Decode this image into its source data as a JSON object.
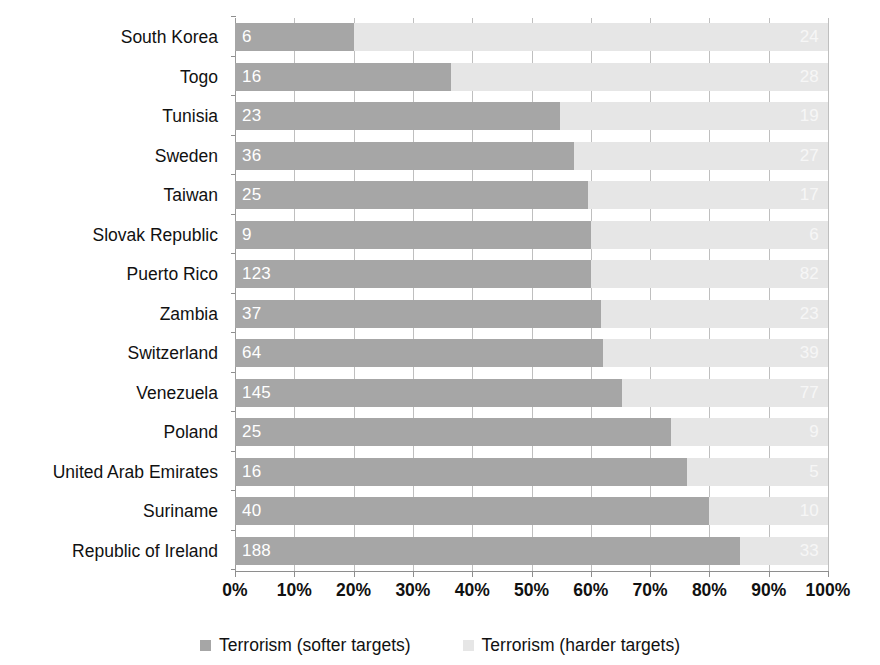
{
  "chart_data": {
    "type": "bar",
    "subtype": "stacked-horizontal-100-percent",
    "title": "",
    "subtitle": "",
    "xlabel": "",
    "ylabel": "",
    "xlim": [
      0,
      100
    ],
    "xtick_labels": [
      "0%",
      "10%",
      "20%",
      "30%",
      "40%",
      "50%",
      "60%",
      "70%",
      "80%",
      "90%",
      "100%"
    ],
    "xtick_values": [
      0,
      10,
      20,
      30,
      40,
      50,
      60,
      70,
      80,
      90,
      100
    ],
    "grid": true,
    "grid_axis": "x",
    "legend_position": "bottom",
    "categories": [
      "South Korea",
      "Togo",
      "Tunisia",
      "Sweden",
      "Taiwan",
      "Slovak Republic",
      "Puerto Rico",
      "Zambia",
      "Switzerland",
      "Venezuela",
      "Poland",
      "United Arab Emirates",
      "Suriname",
      "Republic of Ireland"
    ],
    "series": [
      {
        "name": "Terrorism (softer targets)",
        "color": "#a6a6a6",
        "values": [
          6,
          16,
          23,
          36,
          25,
          9,
          123,
          37,
          64,
          145,
          25,
          16,
          40,
          188
        ],
        "percents": [
          20.0,
          36.4,
          54.8,
          57.1,
          59.5,
          60.0,
          60.0,
          61.7,
          62.1,
          65.3,
          73.5,
          76.2,
          80.0,
          85.1
        ]
      },
      {
        "name": "Terrorism (harder targets)",
        "color": "#e6e6e6",
        "values": [
          24,
          28,
          19,
          27,
          17,
          6,
          82,
          23,
          39,
          77,
          9,
          5,
          10,
          33
        ],
        "percents": [
          80.0,
          63.6,
          45.2,
          42.9,
          40.5,
          40.0,
          40.0,
          38.3,
          37.9,
          34.7,
          26.5,
          23.8,
          20.0,
          14.9
        ]
      }
    ]
  },
  "legend": {
    "items": [
      {
        "label": "Terrorism (softer targets)",
        "color": "#a6a6a6"
      },
      {
        "label": "Terrorism (harder targets)",
        "color": "#e6e6e6"
      }
    ]
  }
}
